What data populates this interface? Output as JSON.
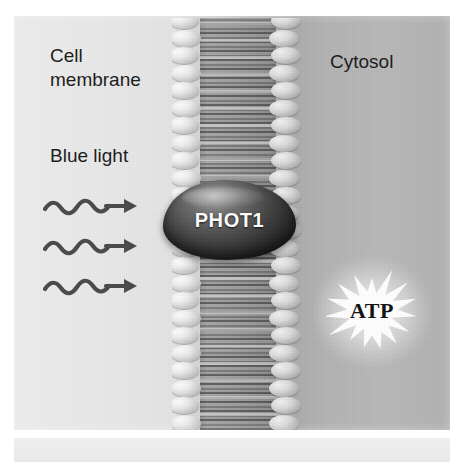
{
  "figure": {
    "background_color": "#ffffff"
  },
  "regions": {
    "extracellular": {
      "name": "extracellular-space",
      "color": "#e9e9e9"
    },
    "membrane": {
      "label": "Cell\nmembrane",
      "name": "lipid-bilayer",
      "head_color": "#ededed",
      "tail_color": "#8e8e8e",
      "head_count_per_leaflet": 24
    },
    "cytosol": {
      "label": "Cytosol",
      "name": "cytosol",
      "color": "#b4b4b4"
    }
  },
  "stimulus": {
    "label": "Blue light",
    "arrow_count": 3,
    "arrow_color": "#4a4a4a",
    "direction": "rightward"
  },
  "protein": {
    "label": "PHOT1",
    "text_color": "#ffffff",
    "body_color": "#262626"
  },
  "product": {
    "label": "ATP",
    "text_color": "#111111",
    "burst_color": "#ffffff",
    "star_points": 15
  },
  "bottom_strip": {
    "color": "#ececec"
  }
}
